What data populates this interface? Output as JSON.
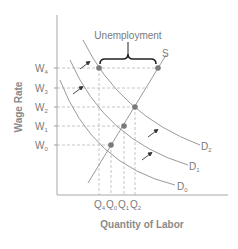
{
  "diagram": {
    "title": "",
    "x_axis_label": "Quantity of Labor",
    "y_axis_label": "Wage Rate",
    "wage_levels": [
      {
        "name": "W4",
        "base": "W",
        "sub": "4"
      },
      {
        "name": "W3",
        "base": "W",
        "sub": "3"
      },
      {
        "name": "W2",
        "base": "W",
        "sub": "2"
      },
      {
        "name": "W1",
        "base": "W",
        "sub": "1"
      },
      {
        "name": "W0",
        "base": "W",
        "sub": "0"
      }
    ],
    "quantity_levels": [
      {
        "name": "Q4",
        "base": "Q",
        "sub": "4"
      },
      {
        "name": "Q0",
        "base": "Q",
        "sub": "0"
      },
      {
        "name": "Q1",
        "base": "Q",
        "sub": "1"
      },
      {
        "name": "Q2",
        "base": "Q",
        "sub": "2"
      }
    ],
    "curves": {
      "supply": {
        "label": "S"
      },
      "demand": [
        {
          "name": "D2",
          "base": "D",
          "sub": "2"
        },
        {
          "name": "D1",
          "base": "D",
          "sub": "1"
        },
        {
          "name": "D0",
          "base": "D",
          "sub": "0"
        }
      ]
    },
    "annotation": {
      "label": "Unemployment"
    },
    "equilibria": [
      {
        "wage": "W0",
        "quantity": "Q0",
        "curve": "D0"
      },
      {
        "wage": "W1",
        "quantity": "Q1",
        "curve": "D1"
      },
      {
        "wage": "W2",
        "quantity": "Q2",
        "curve": "D2"
      }
    ],
    "surplus": {
      "wage": "W4",
      "demanded": "Q4",
      "supplied": "S"
    },
    "colors": {
      "curve": "#9a9a9a",
      "axis": "#a0a0a0",
      "point": "#7a7a7a",
      "dashed": "#b5b5b5",
      "brace": "#222222",
      "text": "#7a7a7a"
    }
  }
}
